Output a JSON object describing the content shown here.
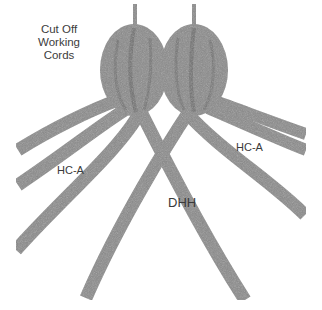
{
  "diagram": {
    "labels": {
      "cut_off": [
        "Cut Off",
        "Working",
        "Cords"
      ],
      "hc_left": "HC-A",
      "hc_right": "HC-A",
      "center": "DHH"
    },
    "colors": {
      "background": "#ffffff",
      "cord": "#8a8a8a",
      "cord_dark": "#6f6f6f",
      "text": "#3a3a3a"
    }
  }
}
